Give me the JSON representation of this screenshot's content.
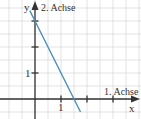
{
  "chart_data": {
    "type": "line",
    "title": "",
    "xlabel": "1. Achse",
    "ylabel": "2. Achse",
    "x_axis_letter": "x",
    "y_axis_letter": "y",
    "x_tick_labels": [
      "1"
    ],
    "y_tick_labels": [
      "1"
    ],
    "xlim": [
      -1.3,
      4.1
    ],
    "ylim": [
      -0.8,
      3.5
    ],
    "grid": true,
    "grid_step": 0.5,
    "series": [
      {
        "name": "y = -2x + 3",
        "color": "#4a8fb8",
        "x": [
          -0.2,
          0,
          1.5,
          1.75
        ],
        "y": [
          3.4,
          3,
          0,
          -0.5
        ]
      }
    ],
    "y_intercept": 3,
    "x_intercept": 1.5
  },
  "colors": {
    "grid": "#dcdcdc",
    "axis": "#333333",
    "line": "#4a8fb8"
  }
}
